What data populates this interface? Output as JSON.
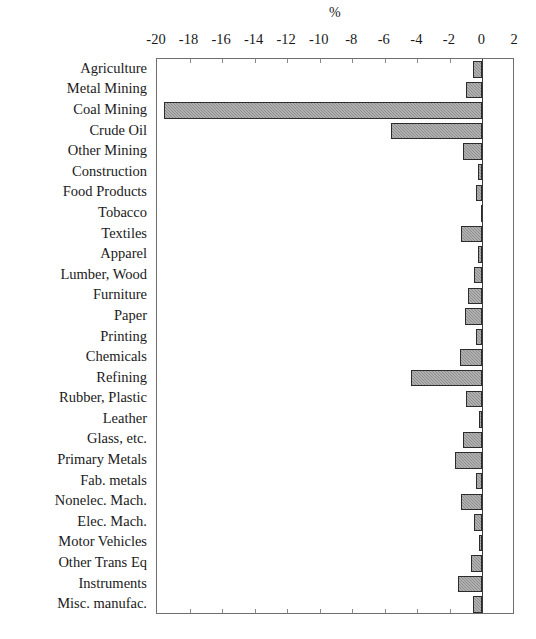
{
  "chart_data": {
    "type": "bar",
    "orientation": "horizontal",
    "title": "",
    "xlabel": "%",
    "ylabel": "",
    "xlim": [
      -20,
      2
    ],
    "xticks": [
      -20,
      -18,
      -16,
      -14,
      -12,
      -10,
      -8,
      -6,
      -4,
      -2,
      0,
      2
    ],
    "xtick_labels": [
      "-20",
      "-18",
      "-16",
      "-14",
      "-12",
      "-10",
      "-8",
      "-6",
      "-4",
      "-2",
      "0",
      "2"
    ],
    "grid": false,
    "legend": false,
    "bar_fill": "#8e8e8e",
    "bar_edge": "#2b2b2b",
    "frame_color": "#6f6f6f",
    "categories": [
      "Agriculture",
      "Metal Mining",
      "Coal Mining",
      "Crude Oil",
      "Other Mining",
      "Construction",
      "Food Products",
      "Tobacco",
      "Textiles",
      "Apparel",
      "Lumber, Wood",
      "Furniture",
      "Paper",
      "Printing",
      "Chemicals",
      "Refining",
      "Rubber, Plastic",
      "Leather",
      "Glass, etc.",
      "Primary Metals",
      "Fab. metals",
      "Nonelec. Mach.",
      "Elec. Mach.",
      "Motor Vehicles",
      "Other Trans Eq",
      "Instruments",
      "Misc. manufac."
    ],
    "values": [
      -0.6,
      -1.0,
      -19.6,
      -5.6,
      -1.2,
      -0.3,
      -0.4,
      -0.1,
      -1.3,
      -0.3,
      -0.5,
      -0.9,
      -1.1,
      -0.4,
      -1.4,
      -4.4,
      -1.0,
      -0.2,
      -1.2,
      -1.7,
      -0.4,
      -1.3,
      -0.5,
      -0.2,
      -0.7,
      -1.5,
      -0.6
    ]
  }
}
